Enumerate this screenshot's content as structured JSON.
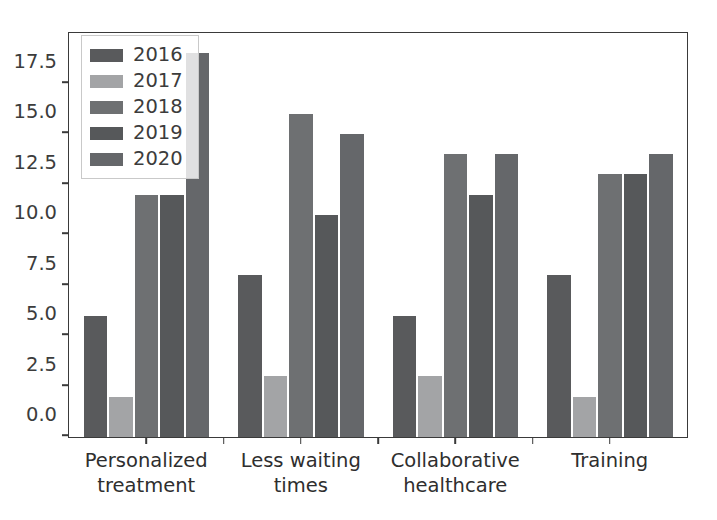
{
  "chart_data": {
    "type": "bar",
    "title": "",
    "xlabel": "",
    "ylabel": "",
    "categories": [
      "Personalized\ntreatment",
      "Less waiting\ntimes",
      "Collaborative\nhealthcare",
      "Training"
    ],
    "series": [
      {
        "name": "2016",
        "values": [
          6,
          8,
          6,
          8
        ],
        "color": "#595a5c"
      },
      {
        "name": "2017",
        "values": [
          2,
          3,
          3,
          2
        ],
        "color": "#a3a4a6"
      },
      {
        "name": "2018",
        "values": [
          12,
          16,
          14,
          13
        ],
        "color": "#6e7072"
      },
      {
        "name": "2019",
        "values": [
          12,
          11,
          12,
          13
        ],
        "color": "#56585a"
      },
      {
        "name": "2020",
        "values": [
          19,
          15,
          14,
          14
        ],
        "color": "#65676a"
      }
    ],
    "ylim": [
      0,
      20
    ],
    "yticks": [
      0.0,
      2.5,
      5.0,
      7.5,
      10.0,
      12.5,
      15.0,
      17.5
    ],
    "ytick_labels": [
      "0.0",
      "2.5",
      "5.0",
      "7.5",
      "10.0",
      "12.5",
      "15.0",
      "17.5"
    ],
    "grid": false,
    "legend": {
      "position": "upper left",
      "entries": [
        "2016",
        "2017",
        "2018",
        "2019",
        "2020"
      ]
    }
  }
}
